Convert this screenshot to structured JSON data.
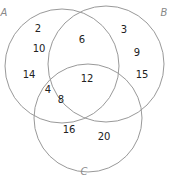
{
  "diagram": {
    "type": "venn",
    "sets": [
      {
        "id": "A",
        "label": "A"
      },
      {
        "id": "B",
        "label": "B"
      },
      {
        "id": "C",
        "label": "C"
      }
    ],
    "regions": [
      {
        "region": "A only",
        "values": [
          "2",
          "10",
          "14"
        ]
      },
      {
        "region": "A∩B only",
        "values": [
          "6"
        ]
      },
      {
        "region": "B only",
        "values": [
          "3",
          "9",
          "15"
        ]
      },
      {
        "region": "A∩B∩C",
        "values": [
          "12"
        ]
      },
      {
        "region": "A∩C only",
        "values": [
          "4",
          "8"
        ]
      },
      {
        "region": "C only",
        "values": [
          "16",
          "20"
        ]
      }
    ]
  }
}
